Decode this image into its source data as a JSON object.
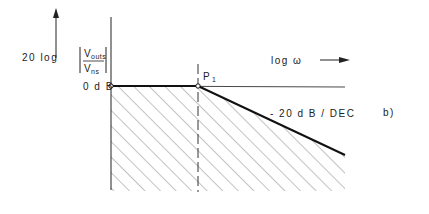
{
  "diagram": {
    "y_axis_label": {
      "prefix": "20 log",
      "numerator": "V",
      "numerator_sub": "outs",
      "denominator": "V",
      "denominator_sub": "ns"
    },
    "x_axis_label": "log ω",
    "level_label": "0 d B",
    "point_label": "P",
    "point_sub": "1",
    "slope_label": "- 20 d B / DEC",
    "panel_label": "b)"
  },
  "colors": {
    "line": "#1a1a1a",
    "hatch": "#555555",
    "background": "#ffffff"
  }
}
